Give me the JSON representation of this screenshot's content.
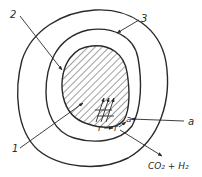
{
  "diagram": {
    "labels": {
      "one": "1",
      "two": "2",
      "three": "3",
      "a_outer": "a",
      "a_inner": "a",
      "r_left": "r",
      "r_right": "r",
      "products": "CO₂ + H₂"
    },
    "colors": {
      "stroke": "#2a2a2a",
      "background": "#ffffff"
    }
  }
}
